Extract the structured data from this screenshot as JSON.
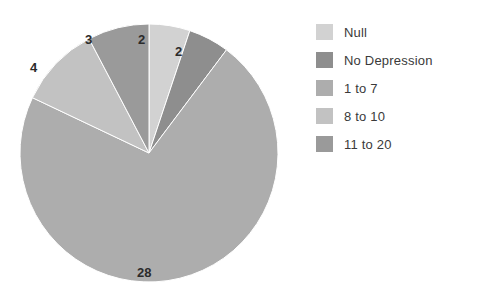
{
  "chart_data": {
    "type": "pie",
    "title": "",
    "subtitle": "",
    "xlabel": "",
    "ylabel": "",
    "grid": false,
    "legend_position": "right",
    "start_angle_deg": 0,
    "direction": "clockwise",
    "total": 39,
    "categories": [
      "Null",
      "No Depression",
      "1 to 7",
      "8 to 10",
      "11 to 20"
    ],
    "values": [
      2,
      2,
      28,
      4,
      3
    ],
    "data_labels": [
      "2",
      "2",
      "28",
      "4",
      "3"
    ],
    "colors": [
      "#d2d2d2",
      "#8e8e8e",
      "#adadad",
      "#c2c2c2",
      "#9a9a9a"
    ],
    "slices": [
      {
        "label": "Null",
        "value": 2,
        "data_label": "2",
        "color": "#d2d2d2"
      },
      {
        "label": "No Depression",
        "value": 2,
        "data_label": "2",
        "color": "#8e8e8e"
      },
      {
        "label": "1 to 7",
        "value": 28,
        "data_label": "28",
        "color": "#adadad"
      },
      {
        "label": "8 to 10",
        "value": 4,
        "data_label": "4",
        "color": "#c2c2c2"
      },
      {
        "label": "11 to 20",
        "value": 3,
        "data_label": "3",
        "color": "#9a9a9a"
      }
    ]
  },
  "labels": {
    "null_count": "2",
    "no_depression_count": "2",
    "range_1_to_7_count": "28",
    "range_8_to_10_count": "4",
    "range_11_to_20_count": "3"
  },
  "legend": {
    "items": [
      {
        "label": "Null",
        "color": "#d2d2d2"
      },
      {
        "label": "No Depression",
        "color": "#8e8e8e"
      },
      {
        "label": "1 to 7",
        "color": "#adadad"
      },
      {
        "label": "8 to 10",
        "color": "#c2c2c2"
      },
      {
        "label": "11 to 20",
        "color": "#9a9a9a"
      }
    ]
  }
}
